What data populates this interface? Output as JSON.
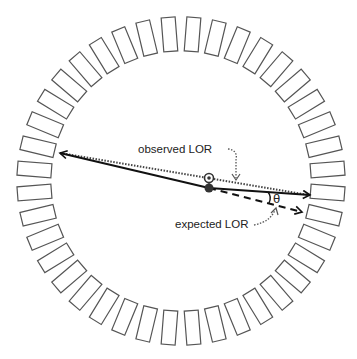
{
  "diagram": {
    "type": "PET detector ring with lines of response",
    "ring": {
      "block_count": 40,
      "center": [
        181,
        181
      ],
      "radius": 147,
      "block_width": 14,
      "block_depth": 34,
      "angle_offset_deg": 4.5,
      "stroke": "#555555"
    },
    "labels": {
      "observed": "observed LOR",
      "expected": "expected LOR",
      "theta": "θ"
    },
    "points": {
      "observed_point": [
        209,
        178
      ],
      "emission_point": [
        209,
        188
      ]
    },
    "lines": {
      "observed_lor": {
        "from": [
          60,
          153
        ],
        "to": [
          310,
          195
        ],
        "style": "dotted"
      },
      "solid_path_left": {
        "from": [
          209,
          188
        ],
        "to": [
          58,
          153
        ],
        "style": "solid"
      },
      "solid_path_right": {
        "from": [
          209,
          188
        ],
        "to": [
          310,
          195
        ],
        "style": "solid"
      },
      "expected_lor": {
        "from": [
          209,
          188
        ],
        "to": [
          302,
          212
        ],
        "style": "dashed"
      }
    }
  }
}
